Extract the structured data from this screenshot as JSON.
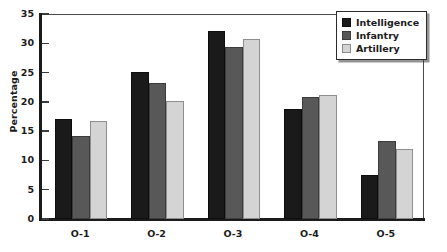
{
  "chart_data": {
    "type": "bar",
    "title": "",
    "xlabel": "",
    "ylabel": "Percentage",
    "categories": [
      "O-1",
      "O-2",
      "O-3",
      "O-4",
      "O-5"
    ],
    "series": [
      {
        "name": "Intelligence",
        "color": "#1a1a1a",
        "values": [
          17.0,
          25.1,
          32.1,
          18.8,
          7.6
        ]
      },
      {
        "name": "Infantry",
        "color": "#585858",
        "values": [
          14.2,
          23.2,
          29.3,
          20.9,
          13.3
        ]
      },
      {
        "name": "Artillery",
        "color": "#d4d4d4",
        "values": [
          16.7,
          20.1,
          30.8,
          21.2,
          12.0
        ]
      }
    ],
    "ylim": [
      0,
      35
    ],
    "yticks": [
      0,
      5,
      10,
      15,
      20,
      25,
      30,
      35
    ],
    "ytick_labels": [
      "0",
      "5",
      "10",
      "15",
      "20",
      "25",
      "30",
      "35"
    ],
    "grid": false,
    "legend_position": "top-right"
  }
}
